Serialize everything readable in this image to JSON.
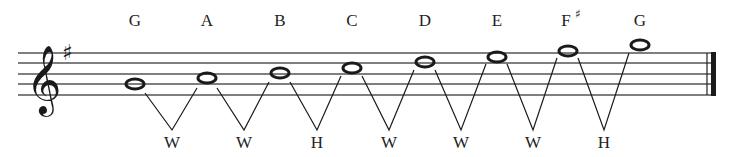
{
  "clef": "treble-clef",
  "key_signature": "♯",
  "notes": [
    {
      "name": "G",
      "accidental": ""
    },
    {
      "name": "A",
      "accidental": ""
    },
    {
      "name": "B",
      "accidental": ""
    },
    {
      "name": "C",
      "accidental": ""
    },
    {
      "name": "D",
      "accidental": ""
    },
    {
      "name": "E",
      "accidental": ""
    },
    {
      "name": "F",
      "accidental": "♯"
    },
    {
      "name": "G",
      "accidental": ""
    }
  ],
  "steps": [
    "W",
    "W",
    "H",
    "W",
    "W",
    "W",
    "H"
  ],
  "colors": {
    "ink": "#1a1a1a",
    "staff": "#555555",
    "background": "#ffffff"
  }
}
